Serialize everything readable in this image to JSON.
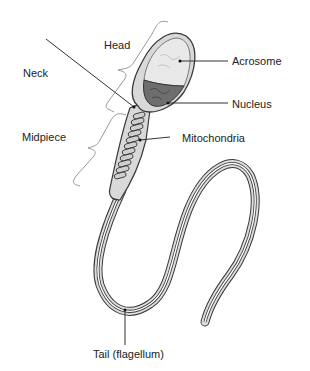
{
  "diagram": {
    "labels": {
      "head": "Head",
      "neck": "Neck",
      "midpiece": "Midpiece",
      "acrosome": "Acrosome",
      "nucleus": "Nucleus",
      "mitochondria": "Mitochondria",
      "tail": "Tail (flagellum)"
    },
    "colors": {
      "outline": "#3a3a3a",
      "body_fill": "#d9d9d9",
      "acrosome_fill": "#e6e6e6",
      "nucleus_fill": "#6e6e6e",
      "leader_line": "#333333",
      "bracket": "#888888"
    }
  }
}
